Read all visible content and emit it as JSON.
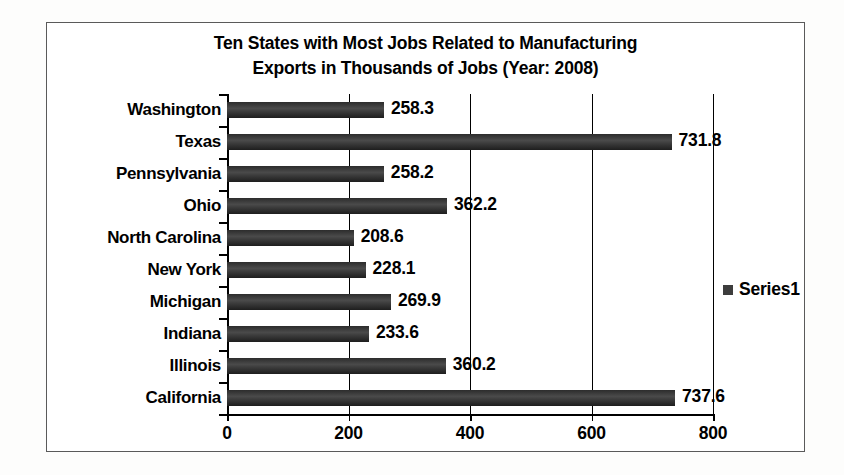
{
  "chart_data": {
    "type": "bar",
    "orientation": "horizontal",
    "title": "Ten States with Most Jobs Related to Manufacturing Exports in Thousands of Jobs (Year: 2008)",
    "title_lines": [
      "Ten States with Most Jobs Related to Manufacturing",
      "Exports in Thousands of Jobs (Year: 2008)"
    ],
    "categories": [
      "Washington",
      "Texas",
      "Pennsylvania",
      "Ohio",
      "North Carolina",
      "New York",
      "Michigan",
      "Indiana",
      "Illinois",
      "California"
    ],
    "values": [
      258.3,
      731.8,
      258.2,
      362.2,
      208.6,
      228.1,
      269.9,
      233.6,
      360.2,
      737.6
    ],
    "data_labels": [
      "258.3",
      "731.8",
      "258.2",
      "362.2",
      "208.6",
      "228.1",
      "269.9",
      "233.6",
      "360.2",
      "737.6"
    ],
    "series": [
      {
        "name": "Series1",
        "values": [
          258.3,
          731.8,
          258.2,
          362.2,
          208.6,
          228.1,
          269.9,
          233.6,
          360.2,
          737.6
        ]
      }
    ],
    "xlabel": "",
    "ylabel": "",
    "xlim": [
      0,
      800
    ],
    "xticks": [
      0,
      200,
      400,
      600,
      800
    ],
    "xtick_labels": [
      "0",
      "200",
      "400",
      "600",
      "800"
    ],
    "grid": "vertical",
    "legend": {
      "entries": [
        "Series1"
      ],
      "position": "right"
    },
    "colors": {
      "bar": "#3d3d3d",
      "grid": "#000000",
      "axis": "#000000",
      "text": "#000000",
      "plot_background": "#ffffff",
      "frame_border": "#5a5a5a"
    }
  }
}
